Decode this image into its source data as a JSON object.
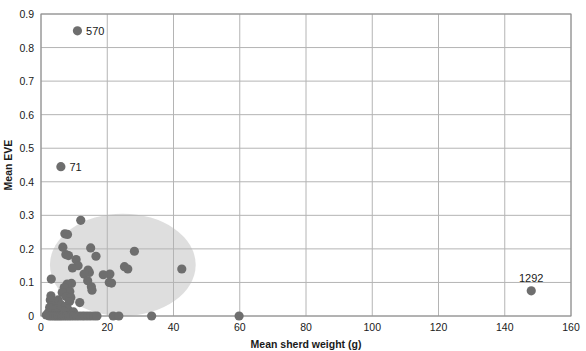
{
  "chart_data": {
    "type": "scatter",
    "title": "",
    "xlabel": "Mean sherd weight (g)",
    "ylabel": "Mean EVE",
    "xlim": [
      0,
      160
    ],
    "ylim": [
      0,
      0.9
    ],
    "xticks": [
      0,
      20,
      40,
      60,
      80,
      100,
      120,
      140,
      160
    ],
    "xtick_labels": [
      "0",
      "20",
      "40",
      "60",
      "80",
      "100",
      "120",
      "140",
      "160"
    ],
    "yticks": [
      0,
      0.1,
      0.2,
      0.3,
      0.4,
      0.5,
      0.6,
      0.7,
      0.8,
      0.9
    ],
    "ytick_labels": [
      "0",
      "0.1",
      "0.2",
      "0.3",
      "0.4",
      "0.5",
      "0.6",
      "0.7",
      "0.8",
      "0.9"
    ],
    "grid": "both",
    "legend": "none",
    "marker": {
      "shape": "circle",
      "color": "#6e6e6e",
      "radius_px": 4.6
    },
    "series": [
      {
        "name": "Assemblages",
        "points": [
          [
            11.0,
            0.85
          ],
          [
            6.0,
            0.445
          ],
          [
            12.0,
            0.285
          ],
          [
            7.2,
            0.245
          ],
          [
            8.0,
            0.243
          ],
          [
            6.6,
            0.205
          ],
          [
            15.0,
            0.203
          ],
          [
            28.2,
            0.193
          ],
          [
            7.5,
            0.183
          ],
          [
            8.3,
            0.18
          ],
          [
            16.6,
            0.178
          ],
          [
            10.6,
            0.168
          ],
          [
            11.2,
            0.15
          ],
          [
            9.5,
            0.143
          ],
          [
            42.5,
            0.14
          ],
          [
            26.2,
            0.14
          ],
          [
            25.2,
            0.147
          ],
          [
            14.2,
            0.137
          ],
          [
            14.6,
            0.13
          ],
          [
            13.0,
            0.125
          ],
          [
            20.8,
            0.125
          ],
          [
            18.8,
            0.123
          ],
          [
            3.1,
            0.11
          ],
          [
            14.1,
            0.105
          ],
          [
            20.6,
            0.1
          ],
          [
            21.3,
            0.098
          ],
          [
            9.2,
            0.097
          ],
          [
            7.9,
            0.095
          ],
          [
            15.2,
            0.087
          ],
          [
            7.0,
            0.085
          ],
          [
            15.4,
            0.077
          ],
          [
            8.7,
            0.073
          ],
          [
            6.4,
            0.07
          ],
          [
            3.0,
            0.06
          ],
          [
            7.6,
            0.058
          ],
          [
            9.0,
            0.055
          ],
          [
            148.0,
            0.075
          ],
          [
            2.8,
            0.048
          ],
          [
            5.2,
            0.048
          ],
          [
            8.6,
            0.043
          ],
          [
            11.7,
            0.04
          ],
          [
            4.1,
            0.035
          ],
          [
            6.1,
            0.033
          ],
          [
            3.4,
            0.03
          ],
          [
            7.3,
            0.028
          ],
          [
            2.6,
            0.025
          ],
          [
            5.0,
            0.022
          ],
          [
            8.1,
            0.02
          ],
          [
            3.8,
            0.018
          ],
          [
            6.8,
            0.015
          ],
          [
            9.8,
            0.012
          ],
          [
            2.2,
            0.01
          ],
          [
            4.6,
            0.008
          ],
          [
            1.6,
            0.003
          ],
          [
            2.5,
            0.0
          ],
          [
            3.2,
            0.0
          ],
          [
            3.9,
            0.0
          ],
          [
            4.5,
            0.0
          ],
          [
            5.1,
            0.0
          ],
          [
            5.7,
            0.0
          ],
          [
            6.3,
            0.0
          ],
          [
            7.0,
            0.0
          ],
          [
            7.7,
            0.0
          ],
          [
            8.4,
            0.0
          ],
          [
            9.1,
            0.0
          ],
          [
            9.9,
            0.0
          ],
          [
            10.7,
            0.0
          ],
          [
            11.5,
            0.0
          ],
          [
            12.4,
            0.0
          ],
          [
            13.2,
            0.0
          ],
          [
            14.1,
            0.0
          ],
          [
            15.0,
            0.0
          ],
          [
            16.0,
            0.0
          ],
          [
            16.9,
            0.0
          ],
          [
            21.8,
            0.0
          ],
          [
            23.5,
            0.0
          ],
          [
            33.4,
            0.0
          ],
          [
            59.8,
            0.0
          ]
        ]
      }
    ],
    "annotations": [
      {
        "label": "570",
        "x": 11.0,
        "y": 0.85,
        "position": "right"
      },
      {
        "label": "71",
        "x": 6.0,
        "y": 0.445,
        "position": "right"
      },
      {
        "label": "1292",
        "x": 148.0,
        "y": 0.075,
        "position": "above"
      }
    ],
    "highlight_region": {
      "kind": "ellipse",
      "label": "main-cluster-ellipse",
      "fill": "#c9c9c9",
      "opacity": 0.62,
      "center": [
        24.7,
        0.1525
      ],
      "radius_x": 22.0,
      "radius_y": 0.1525
    },
    "colors": {
      "marker": "#6e6e6e",
      "gridline": "#b4b4b4",
      "axis": "#8c8c8c",
      "text": "#1a1a1a",
      "plot_background": "#ffffff",
      "ellipse": "#c9c9c9"
    }
  }
}
